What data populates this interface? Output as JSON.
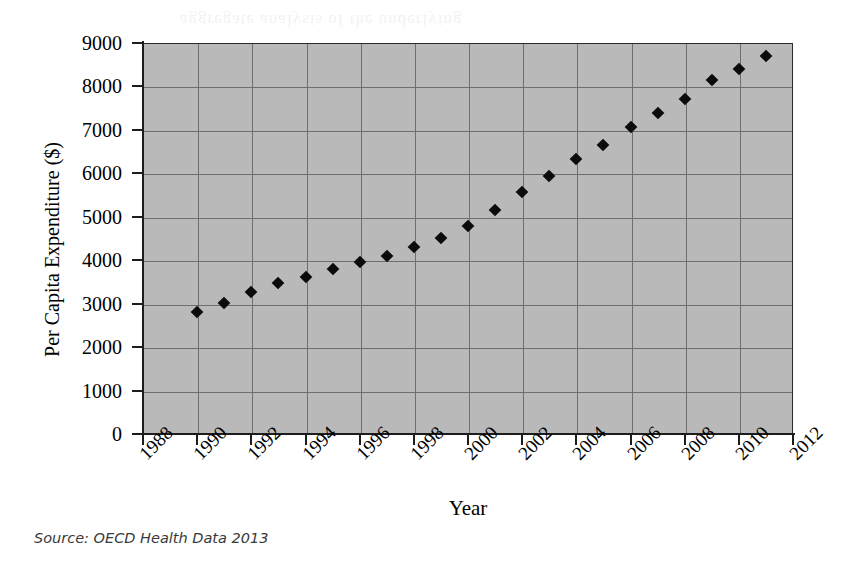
{
  "figure": {
    "background_color": "#ffffff",
    "plot_background_color": "#b9b9b9",
    "gridline_color": "#6e6e6e",
    "marker_color": "#0b0b0b",
    "axis_color": "#1d1d1d",
    "ghost_bleed_text": "aggregate analysis of the underlying"
  },
  "source": {
    "text": "Source: OECD Health Data 2013"
  },
  "chart_data": {
    "type": "scatter",
    "title": "",
    "xlabel": "Year",
    "ylabel": "Per Capita Expenditure ($)",
    "xlim": [
      1988,
      2012
    ],
    "ylim": [
      0,
      9000
    ],
    "grid": true,
    "legend": "none",
    "marker": "diamond",
    "xticks": [
      1988,
      1990,
      1992,
      1994,
      1996,
      1998,
      2000,
      2002,
      2004,
      2006,
      2008,
      2010,
      2012
    ],
    "xtick_labels": [
      "1988",
      "1990",
      "1992",
      "1994",
      "1996",
      "1998",
      "2000",
      "2002",
      "2004",
      "2006",
      "2008",
      "2010",
      "2012"
    ],
    "yticks": [
      0,
      1000,
      2000,
      3000,
      4000,
      5000,
      6000,
      7000,
      8000,
      9000
    ],
    "ytick_labels": [
      "0",
      "1000",
      "2000",
      "3000",
      "4000",
      "5000",
      "6000",
      "7000",
      "8000",
      "9000"
    ],
    "xtick_label_rotation": -45,
    "x": [
      1990,
      1991,
      1992,
      1993,
      1994,
      1995,
      1996,
      1997,
      1998,
      1999,
      2000,
      2001,
      2002,
      2003,
      2004,
      2005,
      2006,
      2007,
      2008,
      2009,
      2010,
      2011
    ],
    "values": [
      2800,
      3020,
      3280,
      3470,
      3620,
      3790,
      3960,
      4100,
      4300,
      4520,
      4790,
      5150,
      5560,
      5950,
      6320,
      6660,
      7060,
      7400,
      7700,
      8150,
      8400,
      8700
    ],
    "series": [
      {
        "name": "Per Capita Expenditure ($)",
        "values": [
          2800,
          3020,
          3280,
          3470,
          3620,
          3790,
          3960,
          4100,
          4300,
          4520,
          4790,
          5150,
          5560,
          5950,
          6320,
          6660,
          7060,
          7400,
          7700,
          8150,
          8400,
          8700
        ]
      }
    ]
  }
}
